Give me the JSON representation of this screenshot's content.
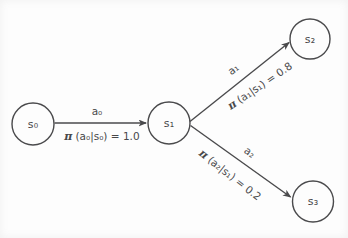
{
  "diagram": {
    "type": "state-transition-policy-diagram",
    "colors": {
      "stroke": "#4a4a4c",
      "text": "#48484a",
      "background": "#fdfdfd"
    },
    "nodes": [
      {
        "id": "s0",
        "label": "s₀"
      },
      {
        "id": "s1",
        "label": "s₁"
      },
      {
        "id": "s2",
        "label": "s₂"
      },
      {
        "id": "s3",
        "label": "s₃"
      }
    ],
    "edges": [
      {
        "from": "s0",
        "to": "s1",
        "action": "a₀",
        "pi_symbol": "π",
        "policy_rest": "(a₀|s₀) = 1.0"
      },
      {
        "from": "s1",
        "to": "s2",
        "action": "a₁",
        "pi_symbol": "π",
        "policy_rest": "(a₁|s₁) = 0.8"
      },
      {
        "from": "s1",
        "to": "s3",
        "action": "a₂",
        "pi_symbol": "π",
        "policy_rest": "(a₂|s₁) = 0.2"
      }
    ]
  }
}
